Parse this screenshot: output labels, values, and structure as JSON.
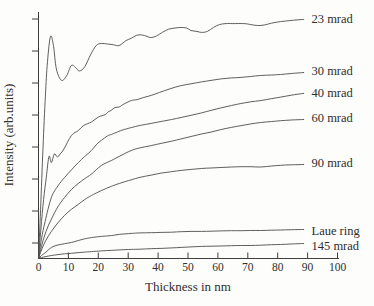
{
  "chart_data": {
    "type": "line",
    "title": "",
    "xlabel": "Thickness in nm",
    "ylabel": "Intensity (arb.units)",
    "xlim": [
      0,
      100
    ],
    "ylim": [
      0,
      100
    ],
    "x_ticks": [
      0,
      10,
      20,
      30,
      40,
      50,
      60,
      70,
      80,
      90,
      100
    ],
    "y_tick_count": 8,
    "y_tick_labels_shown": false,
    "grid": false,
    "legend_position": "right of curve ends",
    "line_color": "#4d4d4d",
    "text_color": "#2e2e2e",
    "series": [
      {
        "name": "23 mrad",
        "label_y_px": 19,
        "points": [
          [
            0,
            0
          ],
          [
            0.7,
            20
          ],
          [
            1.5,
            45
          ],
          [
            2.3,
            66
          ],
          [
            3,
            80
          ],
          [
            4,
            90.3
          ],
          [
            5,
            86.5
          ],
          [
            6,
            77
          ],
          [
            7.7,
            72.4
          ],
          [
            9.5,
            74.5
          ],
          [
            11,
            78.5
          ],
          [
            12.5,
            77.5
          ],
          [
            13.7,
            76.2
          ],
          [
            15.5,
            78
          ],
          [
            17.5,
            83
          ],
          [
            19.3,
            86.6
          ],
          [
            21,
            87.4
          ],
          [
            23,
            87.2
          ],
          [
            25,
            86.9
          ],
          [
            27,
            86.6
          ],
          [
            29.3,
            88.6
          ],
          [
            31,
            89.5
          ],
          [
            32.7,
            90.7
          ],
          [
            34.5,
            90.9
          ],
          [
            36.3,
            90.3
          ],
          [
            37.7,
            89.8
          ],
          [
            39.5,
            90.5
          ],
          [
            41.5,
            92
          ],
          [
            43.5,
            93.2
          ],
          [
            45.7,
            93.7
          ],
          [
            47.7,
            93.9
          ],
          [
            49.5,
            93.7
          ],
          [
            51,
            92.7
          ],
          [
            53,
            92.3
          ],
          [
            54.5,
            91.9
          ],
          [
            56.5,
            92.3
          ],
          [
            58.5,
            93.9
          ],
          [
            60.5,
            95.1
          ],
          [
            62.7,
            95.5
          ],
          [
            65,
            95.5
          ],
          [
            68.7,
            95.5
          ],
          [
            71,
            95.1
          ],
          [
            73.3,
            94.7
          ],
          [
            75.5,
            94.9
          ],
          [
            78,
            95.7
          ],
          [
            81,
            96.3
          ],
          [
            84,
            96.7
          ],
          [
            86.5,
            97
          ],
          [
            88.7,
            97.2
          ]
        ]
      },
      {
        "name": "30 mrad",
        "label_y_px": 71,
        "points": [
          [
            0,
            0
          ],
          [
            0.8,
            12
          ],
          [
            1.7,
            24
          ],
          [
            2.6,
            33
          ],
          [
            3.5,
            41.5
          ],
          [
            4.3,
            39
          ],
          [
            5.3,
            42.5
          ],
          [
            6.3,
            41.3
          ],
          [
            7.3,
            42.5
          ],
          [
            8.5,
            44.5
          ],
          [
            11,
            50
          ],
          [
            13.3,
            52
          ],
          [
            15,
            54
          ],
          [
            17.7,
            55.5
          ],
          [
            20,
            57.5
          ],
          [
            22.3,
            58.5
          ],
          [
            23.3,
            59.6
          ],
          [
            24.3,
            60.2
          ],
          [
            25.6,
            61.4
          ],
          [
            27,
            61.6
          ],
          [
            28.3,
            62.6
          ],
          [
            31,
            64.2
          ],
          [
            33,
            64.6
          ],
          [
            35,
            65.4
          ],
          [
            37.7,
            66.3
          ],
          [
            40.5,
            67.5
          ],
          [
            44,
            69
          ],
          [
            47.7,
            70.3
          ],
          [
            51,
            71
          ],
          [
            54.5,
            71.8
          ],
          [
            57.7,
            72.4
          ],
          [
            61,
            73
          ],
          [
            64.5,
            73.4
          ],
          [
            67.7,
            73.6
          ],
          [
            71,
            74
          ],
          [
            74.3,
            74.4
          ],
          [
            78,
            74.6
          ],
          [
            81,
            74.8
          ],
          [
            84.5,
            75.2
          ],
          [
            88.7,
            75.6
          ]
        ]
      },
      {
        "name": "40 mrad",
        "label_y_px": 93,
        "points": [
          [
            0,
            0
          ],
          [
            1,
            8
          ],
          [
            2.2,
            15
          ],
          [
            4.3,
            24.8
          ],
          [
            6.5,
            29.5
          ],
          [
            8.7,
            32.9
          ],
          [
            11,
            36
          ],
          [
            13.3,
            39
          ],
          [
            15.5,
            41.5
          ],
          [
            17.7,
            43.9
          ],
          [
            19.5,
            46.5
          ],
          [
            21,
            48
          ],
          [
            23,
            49.8
          ],
          [
            24.3,
            50.4
          ],
          [
            26,
            51.2
          ],
          [
            28,
            52.2
          ],
          [
            31,
            53.2
          ],
          [
            34,
            54.1
          ],
          [
            37.7,
            54.9
          ],
          [
            41,
            55.7
          ],
          [
            44.5,
            56.5
          ],
          [
            47.7,
            57.3
          ],
          [
            51,
            58.2
          ],
          [
            54.5,
            59.2
          ],
          [
            57.7,
            60.2
          ],
          [
            61,
            61.2
          ],
          [
            64.5,
            62.2
          ],
          [
            67.7,
            63
          ],
          [
            71,
            63.7
          ],
          [
            74.3,
            64.2
          ],
          [
            78,
            65
          ],
          [
            81,
            65.6
          ],
          [
            84.5,
            66.4
          ],
          [
            88.7,
            67.1
          ]
        ]
      },
      {
        "name": "60 mrad",
        "label_y_px": 118,
        "points": [
          [
            0,
            0
          ],
          [
            1,
            5
          ],
          [
            2.5,
            11
          ],
          [
            4.3,
            16
          ],
          [
            6.5,
            21
          ],
          [
            8.7,
            24.8
          ],
          [
            11,
            28
          ],
          [
            13.3,
            30.5
          ],
          [
            15.5,
            32.5
          ],
          [
            17.7,
            34.3
          ],
          [
            21,
            37.8
          ],
          [
            24.3,
            39.8
          ],
          [
            27,
            41.5
          ],
          [
            31,
            43.9
          ],
          [
            34,
            45
          ],
          [
            37.7,
            45.9
          ],
          [
            41,
            46.8
          ],
          [
            44.5,
            47.7
          ],
          [
            47.7,
            48.6
          ],
          [
            51,
            49.6
          ],
          [
            54.5,
            50.6
          ],
          [
            57.7,
            51.4
          ],
          [
            61,
            52.4
          ],
          [
            64.5,
            53.3
          ],
          [
            67.7,
            54
          ],
          [
            71,
            54.7
          ],
          [
            74.3,
            55.3
          ],
          [
            78,
            55.7
          ],
          [
            81,
            56
          ],
          [
            84.5,
            56.3
          ],
          [
            88.7,
            56.5
          ]
        ]
      },
      {
        "name": "90 mrad",
        "label_y_px": 163,
        "points": [
          [
            0,
            0
          ],
          [
            1,
            3.5
          ],
          [
            2.5,
            7.5
          ],
          [
            4.3,
            11
          ],
          [
            6.5,
            14.5
          ],
          [
            8.7,
            17.5
          ],
          [
            11,
            20
          ],
          [
            13.3,
            22
          ],
          [
            15.5,
            24
          ],
          [
            17.7,
            25.6
          ],
          [
            21,
            27.6
          ],
          [
            24.3,
            29.3
          ],
          [
            27,
            30.5
          ],
          [
            31,
            32
          ],
          [
            34,
            33
          ],
          [
            37.7,
            33.9
          ],
          [
            41,
            34.7
          ],
          [
            44.5,
            35.3
          ],
          [
            47.7,
            35.8
          ],
          [
            51,
            36.2
          ],
          [
            54.5,
            36.6
          ],
          [
            57.7,
            36.8
          ],
          [
            61,
            37
          ],
          [
            64.5,
            37.2
          ],
          [
            67.7,
            37.3
          ],
          [
            71,
            37.3
          ],
          [
            74.3,
            37.2
          ],
          [
            78,
            37.6
          ],
          [
            81,
            37.9
          ],
          [
            84.5,
            38.1
          ],
          [
            88.7,
            38.2
          ]
        ]
      },
      {
        "name": "Laue ring",
        "label_y_px": 231,
        "points": [
          [
            0,
            0
          ],
          [
            1,
            1.2
          ],
          [
            2.5,
            2.6
          ],
          [
            4.3,
            4.5
          ],
          [
            6.5,
            5.5
          ],
          [
            8.7,
            6
          ],
          [
            11,
            6.5
          ],
          [
            13.3,
            7.3
          ],
          [
            15.5,
            8
          ],
          [
            17.7,
            8.5
          ],
          [
            21,
            9
          ],
          [
            24.3,
            9.3
          ],
          [
            27,
            9.8
          ],
          [
            31,
            10.2
          ],
          [
            34,
            10.4
          ],
          [
            37.7,
            10.5
          ],
          [
            41,
            10.6
          ],
          [
            44.5,
            10.7
          ],
          [
            47.7,
            10.9
          ],
          [
            51,
            11
          ],
          [
            54.5,
            11
          ],
          [
            57.7,
            11.1
          ],
          [
            61,
            11.2
          ],
          [
            64.5,
            11.3
          ],
          [
            67.7,
            11.3
          ],
          [
            71,
            11.4
          ],
          [
            74.3,
            11.4
          ],
          [
            78,
            11.5
          ],
          [
            81,
            11.6
          ],
          [
            84.5,
            11.7
          ],
          [
            88.7,
            11.8
          ]
        ]
      },
      {
        "name": "145 mrad",
        "label_y_px": 246,
        "points": [
          [
            0,
            0
          ],
          [
            1,
            0.4
          ],
          [
            2.5,
            0.8
          ],
          [
            4.3,
            1.2
          ],
          [
            6.5,
            1.6
          ],
          [
            8.7,
            1.9
          ],
          [
            11,
            2.1
          ],
          [
            13.3,
            2.4
          ],
          [
            15.5,
            2.6
          ],
          [
            17.7,
            2.8
          ],
          [
            21,
            3.1
          ],
          [
            24.3,
            3.3
          ],
          [
            27,
            3.5
          ],
          [
            31,
            3.7
          ],
          [
            34,
            3.8
          ],
          [
            37.7,
            4
          ],
          [
            41,
            4.1
          ],
          [
            44.5,
            4.3
          ],
          [
            47.7,
            4.5
          ],
          [
            51,
            4.7
          ],
          [
            54.5,
            4.9
          ],
          [
            57.7,
            5
          ],
          [
            61,
            5.1
          ],
          [
            64.5,
            5.2
          ],
          [
            67.7,
            5.3
          ],
          [
            71,
            5.3
          ],
          [
            74.3,
            5.4
          ],
          [
            78,
            5.6
          ],
          [
            81,
            5.7
          ],
          [
            84.5,
            5.9
          ],
          [
            88.7,
            6.1
          ]
        ]
      }
    ]
  }
}
